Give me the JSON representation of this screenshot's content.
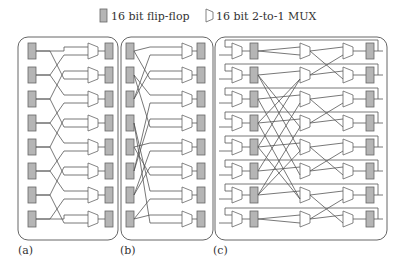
{
  "legend": {
    "flipflop_label": "16 bit flip-flop",
    "mux_label": "16 bit  2-to-1 MUX",
    "flipflop_color": "#b5b5b5",
    "line_color": "#555555"
  },
  "panels": [
    {
      "id": "a",
      "label": "(a)",
      "description": "8 input flip-flops, crossing network into 8 2-to-1 MUXes, 8 output flip-flops"
    },
    {
      "id": "b",
      "label": "(b)",
      "description": "8 input flip-flops, alternative crossing network into 8 2-to-1 MUXes, 8 output flip-flops"
    },
    {
      "id": "c",
      "label": "(c)",
      "description": "8 rows: input MUX with feedback, flip-flop, butterfly crossing stage, MUX stage, pairwise crossing stage, MUX stage, output flip-flop"
    }
  ],
  "rows": 8
}
